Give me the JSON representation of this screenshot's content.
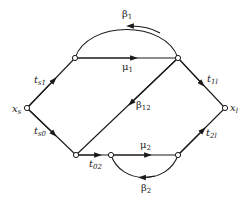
{
  "diagram": {
    "type": "signal-flow-graph",
    "colors": {
      "stroke": "#1a1a1a",
      "background": "#ffffff"
    },
    "nodes": [
      {
        "id": "xs",
        "label": "x",
        "sub": "s"
      },
      {
        "id": "n1",
        "label": ""
      },
      {
        "id": "n2",
        "label": ""
      },
      {
        "id": "xl",
        "label": "x",
        "sub": "l"
      },
      {
        "id": "n3",
        "label": ""
      },
      {
        "id": "n4",
        "label": ""
      },
      {
        "id": "n5",
        "label": ""
      }
    ],
    "edges": [
      {
        "from": "xs",
        "to": "n1",
        "label": "t",
        "sub": "s1"
      },
      {
        "from": "xs",
        "to": "n3",
        "label": "t",
        "sub": "s0"
      },
      {
        "from": "n1",
        "to": "n2",
        "label": "μ",
        "sub": "1"
      },
      {
        "from": "n2",
        "to": "n1",
        "label": "β",
        "sub": "1",
        "shape": "arc-above"
      },
      {
        "from": "n2",
        "to": "n3",
        "label": "β",
        "sub": "12"
      },
      {
        "from": "n2",
        "to": "xl",
        "label": "t",
        "sub": "1l"
      },
      {
        "from": "n3",
        "to": "n4",
        "label": "t",
        "sub": "02"
      },
      {
        "from": "n4",
        "to": "n5",
        "label": "μ",
        "sub": "2"
      },
      {
        "from": "n5",
        "to": "n4",
        "label": "β",
        "sub": "2",
        "shape": "arc-below"
      },
      {
        "from": "n5",
        "to": "xl",
        "label": "t",
        "sub": "2l"
      }
    ]
  }
}
